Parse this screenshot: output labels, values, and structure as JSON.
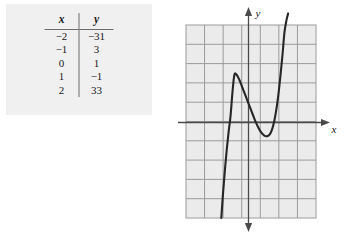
{
  "table": {
    "headers": [
      "x",
      "y"
    ],
    "rows": [
      {
        "x": "−2",
        "y": "−31"
      },
      {
        "x": "−1",
        "y": "3"
      },
      {
        "x": "0",
        "y": "1"
      },
      {
        "x": "1",
        "y": "−1"
      },
      {
        "x": "2",
        "y": "33"
      }
    ]
  },
  "graph": {
    "x_axis_label": "x",
    "y_axis_label": "y",
    "grid": {
      "columns": 7,
      "rows": 10,
      "cell_width": 18.6,
      "cell_height": 19.3,
      "visible": true,
      "fill_color": "#ebebeb",
      "line_color": "#9b9b9b"
    },
    "axis_color": "#4a4a4a",
    "curve_color": "#262626",
    "curve_width": 2.1
  },
  "chart_data": {
    "type": "line",
    "title": "",
    "xlabel": "x",
    "ylabel": "y",
    "grid": true,
    "legend": null,
    "xlim": [
      -3.35,
      3.65
    ],
    "ylim": [
      -5,
      5
    ],
    "table": {
      "x": [
        -2,
        -1,
        0,
        1,
        2
      ],
      "y": [
        -31,
        3,
        1,
        -1,
        33
      ]
    },
    "features": {
      "local_maximum": {
        "x": -0.7,
        "y": 2.45
      },
      "local_minimum": {
        "x": 1.05,
        "y": -0.75
      },
      "enters_bottom_at_x": -1.4,
      "exits_top_at_x": 2.1
    },
    "x": [
      -1.45,
      -1.35,
      -1.25,
      -1.15,
      -1.05,
      -0.95,
      -0.85,
      -0.75,
      -0.65,
      -0.55,
      -0.45,
      -0.35,
      -0.25,
      -0.15,
      -0.05,
      0.05,
      0.15,
      0.25,
      0.35,
      0.45,
      0.55,
      0.65,
      0.75,
      0.85,
      0.95,
      1.05,
      1.15,
      1.25,
      1.35,
      1.45,
      1.55,
      1.65,
      1.75,
      1.85,
      1.95,
      2.05,
      2.15
    ],
    "y": [
      -5.0,
      -3.65,
      -2.45,
      -1.4,
      -0.5,
      0.3,
      1.5,
      2.4,
      2.45,
      2.3,
      2.1,
      1.85,
      1.6,
      1.35,
      1.1,
      0.85,
      0.6,
      0.35,
      0.1,
      -0.12,
      -0.32,
      -0.5,
      -0.62,
      -0.72,
      -0.76,
      -0.75,
      -0.68,
      -0.5,
      -0.2,
      0.25,
      0.85,
      1.6,
      2.5,
      3.5,
      4.6,
      5.2,
      5.6
    ]
  }
}
